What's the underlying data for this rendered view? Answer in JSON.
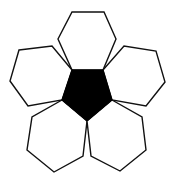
{
  "diagram": {
    "title": "",
    "colors": {
      "background": "#ffffff",
      "pentagon_fill": "#000000",
      "hexagon_fill": "#ffffff",
      "stroke": "#111111"
    },
    "center_pentagon": {
      "label": "",
      "points": "72,70 103,70 112,100 87,121 62,100"
    },
    "hexagons": [
      {
        "id": "top",
        "points": "72,12 104,12 116,39 103,70 72,70 58,39"
      },
      {
        "id": "left",
        "points": "19,50 52,46 72,70 62,100 28,106 10,81"
      },
      {
        "id": "right",
        "points": "103,70 124,46 156,51 165,82 146,106 112,100"
      },
      {
        "id": "bottom-left",
        "points": "62,100 87,121 83,156 54,172 27,150 32,117"
      },
      {
        "id": "bottom-right",
        "points": "87,121 112,100 142,117 146,150 120,171 91,156"
      }
    ]
  }
}
